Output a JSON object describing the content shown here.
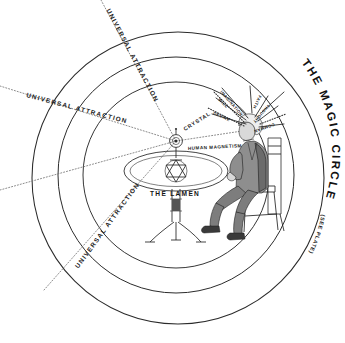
{
  "plate": {
    "title": "THE MAGIC CIRCLE",
    "title_suffix": "· (SEE PLATE)",
    "title_note": "(SEE PLATE)",
    "medium": "engraved diagram"
  },
  "rings": {
    "outer_label": "outer-circle",
    "middle_label": "middle-circle",
    "inner_label": "inner-circle",
    "count": 3
  },
  "attraction_lines": [
    {
      "id": "ua-top",
      "label": "UNIVERSAL ATTRACTION"
    },
    {
      "id": "ua-left",
      "label": "UNIVERSAL ATTRACTION"
    },
    {
      "id": "ua-bottom-left",
      "label": "UNIVERSAL ATTRACTION"
    }
  ],
  "center": {
    "crystal_label": "CRYSTAL",
    "lamen_label": "THE LAMEN",
    "magnetism_label": "HUMAN MAGNETISM"
  },
  "emanations": [
    {
      "id": "ray-1",
      "label": "WILL"
    },
    {
      "id": "ray-2",
      "label": "DESIRE"
    },
    {
      "id": "ray-3",
      "label": "IMAGINATION"
    },
    {
      "id": "ray-4",
      "label": "FAITH"
    },
    {
      "id": "ray-5",
      "label": "THOUGHT"
    },
    {
      "id": "ray-6",
      "label": "COMMAND"
    }
  ],
  "figure": {
    "name": "seated-operator"
  },
  "furniture": {
    "table": "round tripod table",
    "chair": "wooden chair"
  },
  "colors": {
    "ink": "#2b2b2b",
    "paper": "#ffffff",
    "dotted": "#6e6e6e",
    "coat": "#8e8e8e"
  }
}
